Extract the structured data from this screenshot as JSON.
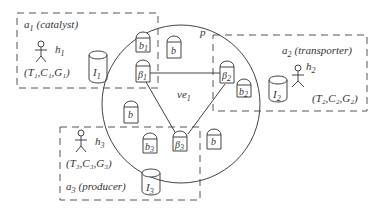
{
  "diagram": {
    "agents": [
      {
        "id": "a1",
        "name": "a",
        "sub": "1",
        "role": "(catalyst)",
        "human": "h",
        "human_sub": "1",
        "tuple": "(T₁,C₁,G₁)",
        "inventory": "I",
        "inventory_sub": "1"
      },
      {
        "id": "a2",
        "name": "a",
        "sub": "2",
        "role": "(transporter)",
        "human": "h",
        "human_sub": "2",
        "tuple": "(T₂,C₂,G₂)",
        "inventory": "I",
        "inventory_sub": "2"
      },
      {
        "id": "a3",
        "name": "a",
        "sub": "3",
        "role": "(producer)",
        "human": "h",
        "human_sub": "3",
        "tuple": "(T₃,C₃,G₃)",
        "inventory": "I",
        "inventory_sub": "3"
      }
    ],
    "platform": {
      "label": "p"
    },
    "virtual_enterprise": {
      "label": "ve",
      "sub": "1"
    },
    "bots": [
      {
        "label": "b",
        "sub": "1"
      },
      {
        "label": "b",
        "sub": ""
      },
      {
        "label": "b",
        "sub": "2"
      },
      {
        "label": "b",
        "sub": ""
      },
      {
        "label": "b",
        "sub": "3"
      },
      {
        "label": "b",
        "sub": ""
      }
    ],
    "brokers": [
      {
        "label": "β",
        "sub": "1"
      },
      {
        "label": "β",
        "sub": "2"
      },
      {
        "label": "β",
        "sub": "3"
      }
    ],
    "colors": {
      "stroke": "#444444",
      "background": "#ffffff"
    }
  }
}
